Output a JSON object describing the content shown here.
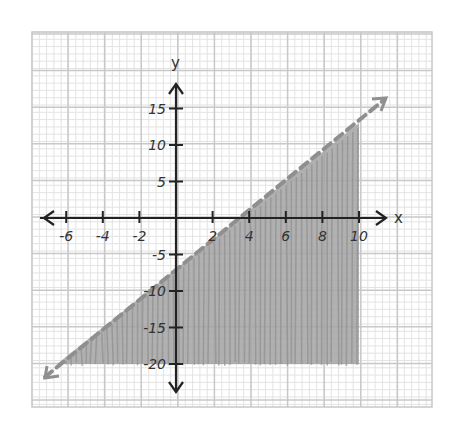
{
  "chart_data": {
    "type": "inequality-graph",
    "title": "",
    "xlabel": "x",
    "ylabel": "y",
    "x_ticks": [
      "-6",
      "-4",
      "-2",
      "2",
      "4",
      "6",
      "8",
      "10"
    ],
    "y_ticks": [
      "15",
      "10",
      "5",
      "-5",
      "-10",
      "-15",
      "-20"
    ],
    "xlim": [
      -7,
      11
    ],
    "ylim": [
      -21,
      19
    ],
    "grid": true,
    "boundary_line": {
      "equation": "y = 2x - 7",
      "style": "dashed",
      "color": "#999999"
    },
    "shaded_region": {
      "description": "below the line, bounded by x <= 10 and y >= -20",
      "inequality": "y < 2x - 7",
      "color": "#9e9e9e"
    }
  },
  "labels": {
    "x_axis": "x",
    "y_axis": "y",
    "x_ticks": [
      {
        "v": -6,
        "t": "-6"
      },
      {
        "v": -4,
        "t": "-4"
      },
      {
        "v": -2,
        "t": "-2"
      },
      {
        "v": 2,
        "t": "2"
      },
      {
        "v": 4,
        "t": "4"
      },
      {
        "v": 6,
        "t": "6"
      },
      {
        "v": 8,
        "t": "8"
      },
      {
        "v": 10,
        "t": "10"
      }
    ],
    "y_ticks": [
      {
        "v": 15,
        "t": "15"
      },
      {
        "v": 10,
        "t": "10"
      },
      {
        "v": 5,
        "t": "5"
      },
      {
        "v": -5,
        "t": "-5"
      },
      {
        "v": -10,
        "t": "-10"
      },
      {
        "v": -15,
        "t": "-15"
      },
      {
        "v": -20,
        "t": "-20"
      }
    ]
  }
}
